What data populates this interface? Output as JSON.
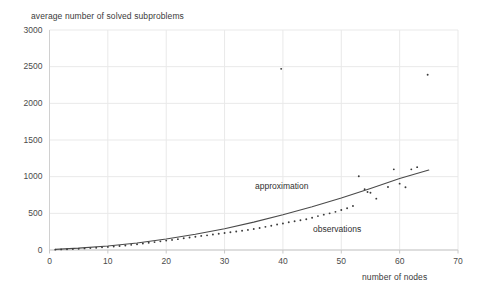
{
  "chart_data": {
    "type": "scatter",
    "title": "",
    "ylabel": "average number of solved subproblems",
    "xlabel": "number of nodes",
    "xlim": [
      0,
      70
    ],
    "ylim": [
      0,
      3000
    ],
    "xticks": [
      0,
      10,
      20,
      30,
      40,
      50,
      60,
      70
    ],
    "yticks": [
      0,
      500,
      1000,
      1500,
      2000,
      2500,
      3000
    ],
    "grid": true,
    "legend_position": "inline-annotations",
    "annotations": [
      {
        "text": "approximation",
        "x": 35.0,
        "y": 870
      },
      {
        "text": "observations",
        "x": 45.0,
        "y": 290
      }
    ],
    "series": [
      {
        "name": "observations",
        "type": "scatter",
        "marker": "point",
        "color": "#3b3b3b",
        "points": [
          [
            1,
            5
          ],
          [
            2,
            8
          ],
          [
            3,
            10
          ],
          [
            4,
            14
          ],
          [
            5,
            18
          ],
          [
            6,
            22
          ],
          [
            7,
            26
          ],
          [
            8,
            31
          ],
          [
            9,
            36
          ],
          [
            10,
            42
          ],
          [
            11,
            48
          ],
          [
            12,
            55
          ],
          [
            13,
            62
          ],
          [
            14,
            70
          ],
          [
            15,
            79
          ],
          [
            16,
            88
          ],
          [
            17,
            98
          ],
          [
            18,
            108
          ],
          [
            19,
            118
          ],
          [
            20,
            128
          ],
          [
            21,
            138
          ],
          [
            22,
            148
          ],
          [
            23,
            160
          ],
          [
            24,
            170
          ],
          [
            25,
            180
          ],
          [
            26,
            192
          ],
          [
            27,
            200
          ],
          [
            28,
            212
          ],
          [
            29,
            222
          ],
          [
            30,
            232
          ],
          [
            31,
            243
          ],
          [
            32,
            252
          ],
          [
            33,
            262
          ],
          [
            34,
            274
          ],
          [
            35,
            286
          ],
          [
            36,
            300
          ],
          [
            37,
            316
          ],
          [
            38,
            330
          ],
          [
            39,
            348
          ],
          [
            40,
            362
          ],
          [
            41,
            378
          ],
          [
            42,
            392
          ],
          [
            43,
            405
          ],
          [
            44,
            420
          ],
          [
            45,
            440
          ],
          [
            46,
            462
          ],
          [
            47,
            482
          ],
          [
            48,
            500
          ],
          [
            49,
            520
          ],
          [
            50,
            545
          ],
          [
            51,
            570
          ],
          [
            52,
            600
          ],
          [
            53,
            1005
          ],
          [
            54,
            830
          ],
          [
            54.5,
            790
          ],
          [
            55,
            780
          ],
          [
            56,
            700
          ],
          [
            58,
            860
          ],
          [
            59,
            1100
          ],
          [
            60,
            905
          ],
          [
            61,
            855
          ],
          [
            62,
            1100
          ],
          [
            63,
            1130
          ],
          [
            39.7,
            2470
          ],
          [
            64.8,
            2390
          ]
        ]
      },
      {
        "name": "approximation",
        "type": "line",
        "color": "#4a4a4a",
        "points": [
          [
            1,
            8
          ],
          [
            5,
            25
          ],
          [
            10,
            55
          ],
          [
            15,
            95
          ],
          [
            20,
            150
          ],
          [
            25,
            215
          ],
          [
            30,
            290
          ],
          [
            35,
            380
          ],
          [
            40,
            480
          ],
          [
            45,
            590
          ],
          [
            50,
            710
          ],
          [
            55,
            840
          ],
          [
            60,
            975
          ],
          [
            65,
            1090
          ]
        ]
      }
    ]
  }
}
